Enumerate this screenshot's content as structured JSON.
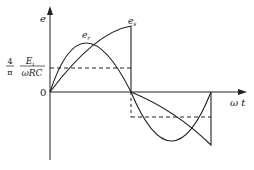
{
  "diagram": {
    "type": "waveform",
    "y_axis_label": "e",
    "x_axis_label": "ω t",
    "origin_label": "0",
    "level_label_coef_num": "4",
    "level_label_coef_den": "π",
    "level_label_num": "E",
    "level_label_num_sub": "i",
    "level_label_den": "ωRC",
    "curve_labels": [
      "e",
      "e"
    ],
    "curve_label_subs": [
      "r",
      "s"
    ],
    "colors": {
      "stroke": "#222222",
      "background": "#ffffff"
    }
  }
}
